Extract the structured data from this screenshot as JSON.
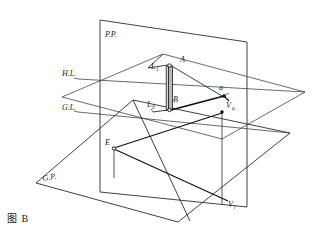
{
  "figure": {
    "caption": "图 B",
    "planes": [
      {
        "id": "picture-plane",
        "label": "P.P.",
        "label_x": 105,
        "label_y": 37
      },
      {
        "id": "ground-plane",
        "label": "G.P.",
        "label_x": 43,
        "label_y": 181
      }
    ],
    "reference_lines": [
      {
        "id": "horizon-line",
        "label": "H.L.",
        "label_x": 62,
        "label_y": 76
      },
      {
        "id": "ground-line",
        "label": "G.L.",
        "label_x": 62,
        "label_y": 110
      }
    ],
    "points": [
      {
        "id": "point-A",
        "label": "A",
        "sub": "",
        "label_x": 180,
        "label_y": 62
      },
      {
        "id": "point-B",
        "label": "B",
        "sub": "",
        "label_x": 173,
        "label_y": 102
      },
      {
        "id": "point-a",
        "label": "a",
        "sub": "",
        "label_x": 219,
        "label_y": 90
      },
      {
        "id": "point-L-upper",
        "label": "L",
        "sub": "1",
        "label_x": 151,
        "label_y": 69
      },
      {
        "id": "point-L-lower",
        "label": "L",
        "sub": "0",
        "label_x": 149,
        "label_y": 107
      },
      {
        "id": "point-E",
        "label": "E",
        "sub": "",
        "label_x": 105,
        "label_y": 145
      },
      {
        "id": "vanish-Va",
        "label": "V",
        "sub": "a",
        "label_x": 228,
        "label_y": 108
      },
      {
        "id": "vanish-Vl",
        "label": "V",
        "sub": "l",
        "label_x": 230,
        "label_y": 207
      }
    ],
    "colors": {
      "ink": "#1a1a1a",
      "plane_stroke": "#2b2b2b",
      "column_fill": "#b8b8b8",
      "background": "#ffffff"
    }
  }
}
